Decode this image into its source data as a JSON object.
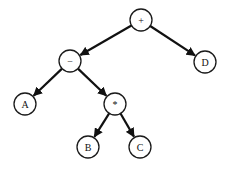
{
  "diagram": {
    "type": "expression-tree",
    "nodes": [
      {
        "id": "plus",
        "label": "+",
        "x": 141,
        "y": 20
      },
      {
        "id": "minus",
        "label": "−",
        "x": 70,
        "y": 61
      },
      {
        "id": "D",
        "label": "D",
        "x": 205,
        "y": 62
      },
      {
        "id": "A",
        "label": "A",
        "x": 25,
        "y": 104
      },
      {
        "id": "times",
        "label": "*",
        "x": 115,
        "y": 104
      },
      {
        "id": "B",
        "label": "B",
        "x": 88,
        "y": 147
      },
      {
        "id": "C",
        "label": "C",
        "x": 140,
        "y": 147
      }
    ],
    "edges": [
      {
        "from": "plus",
        "to": "minus"
      },
      {
        "from": "plus",
        "to": "D"
      },
      {
        "from": "minus",
        "to": "A"
      },
      {
        "from": "minus",
        "to": "times"
      },
      {
        "from": "times",
        "to": "B"
      },
      {
        "from": "times",
        "to": "C"
      }
    ],
    "node_radius": 11
  }
}
